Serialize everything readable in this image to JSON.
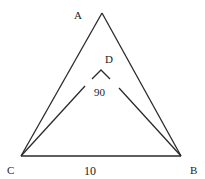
{
  "diagram": {
    "type": "geometry-triangle",
    "colors": {
      "stroke": "#2a2a2a",
      "text": "#222222",
      "background": "#ffffff"
    },
    "points": {
      "A": {
        "label": "A",
        "x": 102,
        "y": 13
      },
      "B": {
        "label": "B",
        "x": 181,
        "y": 156
      },
      "C": {
        "label": "C",
        "x": 21,
        "y": 156
      },
      "D": {
        "label": "D",
        "x": 101,
        "y": 69
      }
    },
    "labels": {
      "A": "A",
      "B": "B",
      "C": "C",
      "D": "D",
      "angle_CDB": "90",
      "side_CB": "10"
    },
    "segments": [
      {
        "name": "AC",
        "from": "A",
        "to": "C"
      },
      {
        "name": "AB",
        "from": "A",
        "to": "B"
      },
      {
        "name": "CB",
        "from": "C",
        "to": "B"
      },
      {
        "name": "CD",
        "from": "C",
        "to": "D",
        "note": "drawn partially (broken near D)"
      },
      {
        "name": "BD",
        "from": "B",
        "to": "D",
        "note": "drawn partially (broken near D)"
      }
    ],
    "annotations": {
      "right_angle_at_D": "90",
      "length_CB": "10"
    }
  }
}
